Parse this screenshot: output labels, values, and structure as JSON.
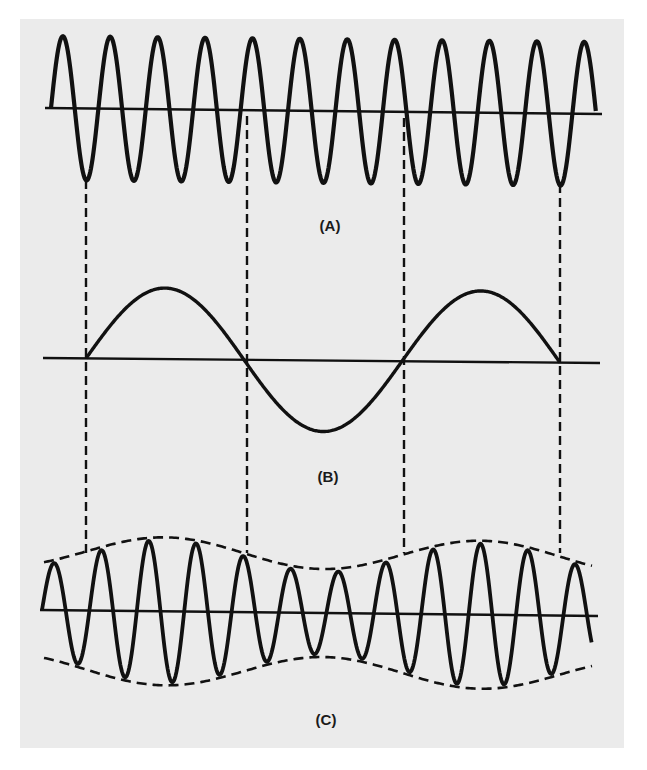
{
  "figure": {
    "background": "#ffffff",
    "panel_color": "#ebebeb",
    "ink_color": "#111111",
    "panel": {
      "x": 20,
      "y": 19,
      "width": 604,
      "height": 729
    }
  },
  "labels": {
    "a": "(A)",
    "b": "(B)",
    "c": "(C)"
  },
  "chart_data": [
    {
      "type": "line",
      "name": "A",
      "description": "Carrier wave - constant amplitude high-frequency sinusoid",
      "label": "(A)",
      "axis": {
        "x0": 45,
        "x1": 602,
        "y0": 108,
        "y1": 114
      },
      "wave": {
        "x_start": 51,
        "x_end": 596,
        "period": 47.4,
        "amplitude": 72,
        "phase": 0
      },
      "cycles_visible": 11.5
    },
    {
      "type": "line",
      "name": "B",
      "description": "Modulating signal - low-frequency sinusoid",
      "label": "(B)",
      "axis": {
        "x0": 43,
        "x1": 600,
        "y0": 358,
        "y1": 363
      },
      "wave": {
        "x_start": 86,
        "x_end": 560,
        "period": 316,
        "amplitude": 71,
        "phase": 0
      },
      "zero_crossings_x": [
        86,
        245,
        403,
        560
      ]
    },
    {
      "type": "line",
      "name": "C",
      "description": "Amplitude-modulated wave with dashed envelope following (B)",
      "label": "(C)",
      "axis": {
        "x0": 40,
        "x1": 598,
        "y0": 610,
        "y1": 616
      },
      "wave": {
        "x_start": 42,
        "x_end": 592,
        "period": 47.4,
        "carrier_amplitude": 56,
        "modulation_depth": 15,
        "mod_period": 316,
        "mod_start": 86
      },
      "envelope": {
        "x_start": 44,
        "x_end": 592,
        "dashed": true
      }
    }
  ],
  "dashed_guides": {
    "x": [
      86,
      247,
      404,
      560
    ],
    "segments": [
      {
        "y_top": 180,
        "y_bottom": 553
      },
      {
        "y_top": 116,
        "y_bottom": 553
      },
      {
        "y_top": 118,
        "y_bottom": 553
      },
      {
        "y_top": 184,
        "y_bottom": 553
      }
    ]
  },
  "label_positions": {
    "a": {
      "x": 330,
      "y": 231
    },
    "b": {
      "x": 328,
      "y": 482
    },
    "c": {
      "x": 326,
      "y": 725
    }
  }
}
